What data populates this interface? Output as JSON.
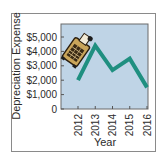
{
  "chart_data": {
    "type": "line",
    "title": "",
    "xlabel": "Year",
    "ylabel": "Depreciation Expense",
    "categories": [
      "2012",
      "2013",
      "2014",
      "2015",
      "2016"
    ],
    "series": [
      {
        "name": "Depreciation Expense",
        "values": [
          2000,
          4400,
          2700,
          3500,
          1500
        ],
        "color": "#1f8f80"
      }
    ],
    "ylim": [
      0,
      6000
    ],
    "yticks": [
      0,
      1000,
      2000,
      3000,
      4000,
      5000
    ],
    "ytick_labels": [
      "0",
      "$1,000",
      "$2,000",
      "$3,000",
      "$4,000",
      "$5,000"
    ],
    "grid": false,
    "legend": null,
    "annotations": [
      "adding-machine illustration near 2012–2013"
    ],
    "plot_background": "#bfd4e6"
  },
  "colors": {
    "plot_background": "#bfd4e6",
    "line": "#1f8f80",
    "axis": "#555555",
    "frame": "#8a8a8a"
  },
  "icons": {
    "illustration": "adding-machine-icon"
  }
}
